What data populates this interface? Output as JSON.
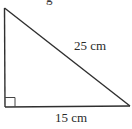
{
  "figure": {
    "type": "right-triangle",
    "right_angle_vertex": "bottom-left",
    "top_fragment_text": "g",
    "hypotenuse": {
      "label": "25 cm",
      "value": 25,
      "unit": "cm"
    },
    "base": {
      "label": "15 cm",
      "value": 15,
      "unit": "cm"
    },
    "colors": {
      "stroke": "#2f2f2f",
      "text": "#2a2a2a",
      "background": "#ffffff"
    }
  }
}
